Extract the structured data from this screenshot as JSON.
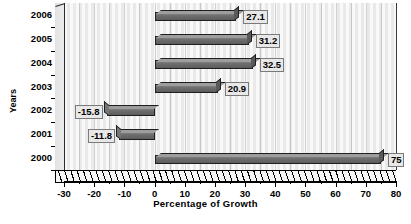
{
  "chart_data": {
    "type": "bar",
    "orientation": "horizontal",
    "title": "",
    "xlabel": "Percentage of Growth",
    "ylabel": "Years",
    "categories": [
      "2006",
      "2005",
      "2004",
      "2003",
      "2002",
      "2001",
      "2000"
    ],
    "values": [
      27.1,
      31.2,
      32.5,
      20.9,
      -15.8,
      -11.8,
      75
    ],
    "value_labels": [
      "27.1",
      "31.2",
      "32.5",
      "20.9",
      "-15.8",
      "-11.8",
      "75"
    ],
    "xlim": [
      -30,
      80
    ],
    "xticks": [
      -30,
      -20,
      -10,
      0,
      10,
      20,
      30,
      40,
      50,
      60,
      70,
      80
    ],
    "xtick_labels": [
      "-30",
      "-20",
      "-10",
      "0",
      "10",
      "20",
      "30",
      "40",
      "50",
      "60",
      "70",
      "80"
    ],
    "minor_tick_step": 5,
    "grid": "vertical",
    "legend": "none",
    "style": "3d",
    "bar_color": "#6f6f6f",
    "plot_background": "#f2f2f2",
    "axis_color": "#000000"
  },
  "footer": {
    "source_note": ""
  }
}
